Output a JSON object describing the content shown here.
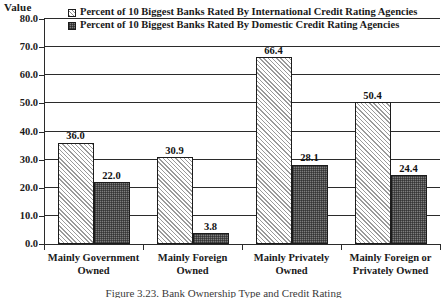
{
  "chart_data": {
    "type": "bar",
    "title": "",
    "xlabel": "",
    "ylabel": "Value",
    "ylim": [
      0.0,
      80.0
    ],
    "ytick_step": 10.0,
    "ytick_labels": [
      "0.0",
      "10.0",
      "20.0",
      "30.0",
      "40.0",
      "50.0",
      "60.0",
      "70.0",
      "80.0"
    ],
    "grid": true,
    "grid_axis": "y",
    "legend_position": "top-center-inside",
    "categories": [
      "Mainly Government Owned",
      "Mainly Foreign Owned",
      "Mainly Privately Owned",
      "Mainly Foreign or Privately Owned"
    ],
    "category_lines": [
      [
        "Mainly Government",
        "Owned"
      ],
      [
        "Mainly Foreign",
        "Owned"
      ],
      [
        "Mainly Privately",
        "Owned"
      ],
      [
        "Mainly Foreign or",
        "Privately Owned"
      ]
    ],
    "series": [
      {
        "name": "Percent of 10 Biggest Banks Rated By International Credit Rating Agencies",
        "pattern": "light-diagonal-hatch",
        "color": "#d9d9d9",
        "values": [
          36.0,
          30.9,
          66.4,
          50.4
        ],
        "labels": [
          "36.0",
          "30.9",
          "66.4",
          "50.4"
        ]
      },
      {
        "name": "Percent of 10 Biggest Banks Rated By Domestic Credit Rating Agencies",
        "pattern": "dark-checker-hatch",
        "color": "#7d7d7d",
        "values": [
          22.0,
          3.8,
          28.1,
          24.4
        ],
        "labels": [
          "22.0",
          "3.8",
          "28.1",
          "24.4"
        ]
      }
    ]
  },
  "axis": {
    "y_title": "Value"
  },
  "legend": {
    "items": [
      {
        "label": "Percent of 10 Biggest Banks Rated By International Credit Rating Agencies"
      },
      {
        "label": "Percent of 10 Biggest Banks Rated By Domestic Credit Rating Agencies"
      }
    ]
  },
  "caption": {
    "text": "Figure 3.23. Bank Ownership Type and Credit Rating"
  }
}
